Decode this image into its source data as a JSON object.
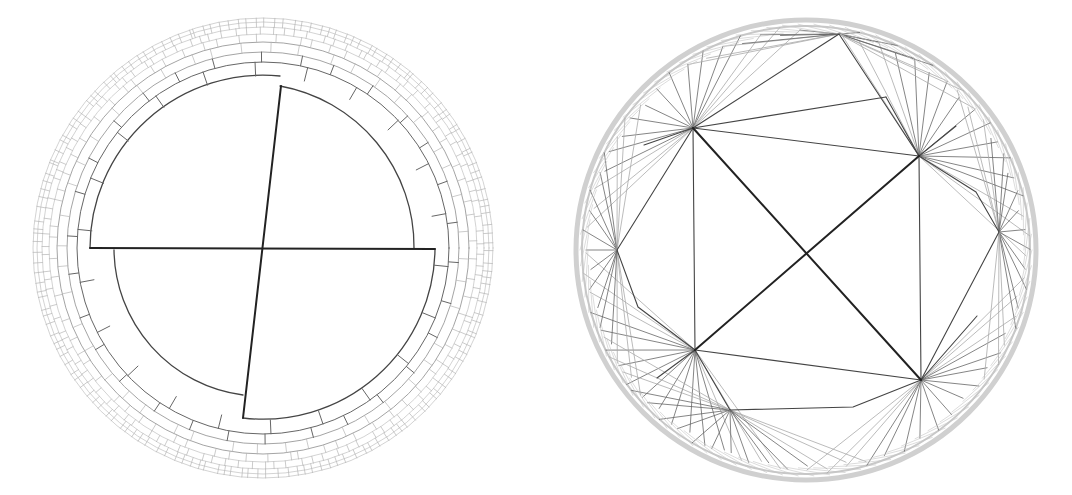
{
  "figure": {
    "panels": [
      {
        "id": "left",
        "kind": "radial-space-partition",
        "center": [
          263,
          248
        ],
        "outer_radius": 230,
        "inner_radius": 172,
        "ring_radii": [
          172,
          186,
          196,
          206,
          214,
          221,
          226,
          230
        ],
        "stroke_dark": "#222222",
        "stroke_mid": "#555555",
        "stroke_light": "#bbbbbb"
      },
      {
        "id": "right",
        "kind": "triangulated-disk",
        "center": [
          806,
          250
        ],
        "outer_radius": 230,
        "stroke_dark": "#222222",
        "stroke_mid": "#444444",
        "stroke_light": "#bbbbbb"
      }
    ]
  }
}
